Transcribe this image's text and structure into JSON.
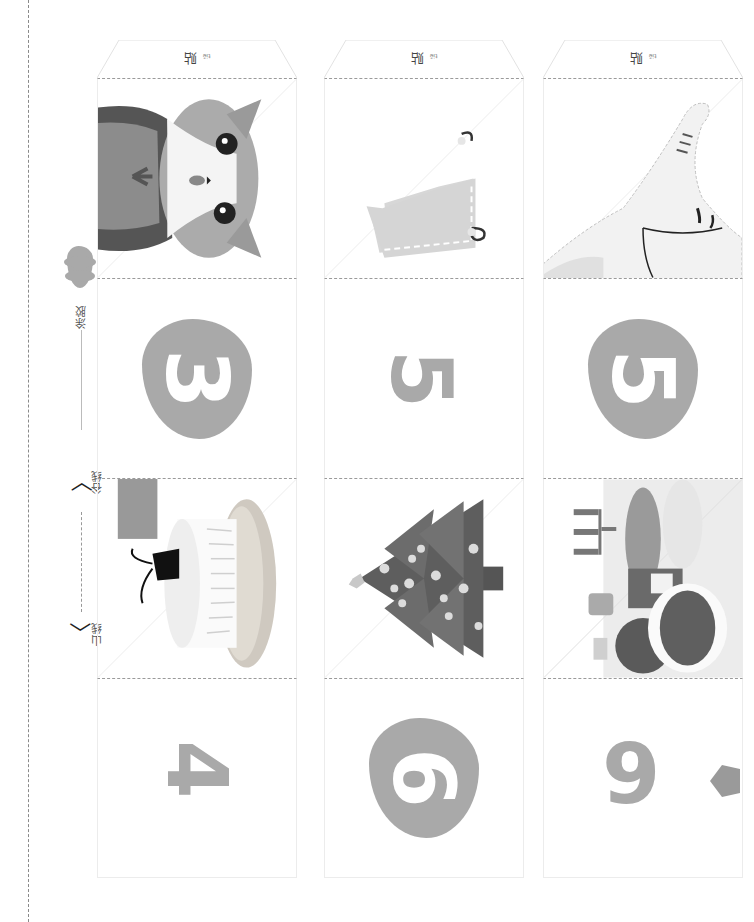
{
  "legend": {
    "glue_label": "涂胶",
    "glue_ruby": "tú jiāo",
    "valley_label": "谷线",
    "valley_ruby": "gǔ xiàn",
    "mountain_label": "山线",
    "mountain_ruby": "shān xiàn",
    "valley_arrow_glyph": "〈",
    "mountain_arrow_glyph": "〈"
  },
  "columns": [
    {
      "tab_label": "贴",
      "tab_ruby": "tiē",
      "cells": [
        {
          "type": "illustration",
          "subject": "cat-face"
        },
        {
          "type": "blob-digit",
          "digit": "3"
        },
        {
          "type": "illustration",
          "subject": "cake-with-mouse"
        },
        {
          "type": "plain-digit",
          "digit": "4"
        }
      ]
    },
    {
      "tab_label": "贴",
      "tab_ruby": "tiē",
      "cells": [
        {
          "type": "illustration",
          "subject": "stocking-tag"
        },
        {
          "type": "plain-digit",
          "digit": "5"
        },
        {
          "type": "illustration",
          "subject": "christmas-tree"
        },
        {
          "type": "blob-digit",
          "digit": "6"
        }
      ]
    },
    {
      "tab_label": "贴",
      "tab_ruby": "tiē",
      "cells": [
        {
          "type": "illustration",
          "subject": "elephant"
        },
        {
          "type": "blob-digit",
          "digit": "5"
        },
        {
          "type": "illustration",
          "subject": "christmas-dinner-table"
        },
        {
          "type": "plain-digit",
          "digit": "9"
        }
      ]
    }
  ],
  "colors": {
    "digit_gray": "#a9a9a9",
    "fold_line": "#9a9a9a",
    "cut_line": "#8a8a8a"
  }
}
